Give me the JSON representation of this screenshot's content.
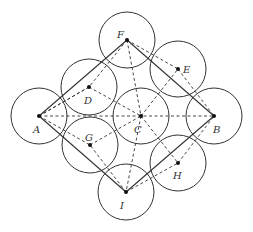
{
  "diagram": {
    "radius": 28,
    "points": {
      "A": {
        "x": 39,
        "y": 116,
        "label": "A",
        "lx": 33,
        "ly": 133
      },
      "B": {
        "x": 214,
        "y": 116,
        "label": "B",
        "lx": 213,
        "ly": 133
      },
      "C": {
        "x": 141,
        "y": 116,
        "label": "C",
        "lx": 134,
        "ly": 133
      },
      "D": {
        "x": 89,
        "y": 87,
        "label": "D",
        "lx": 84,
        "ly": 104
      },
      "E": {
        "x": 178,
        "y": 69,
        "label": "E",
        "lx": 183,
        "ly": 73
      },
      "F": {
        "x": 127,
        "y": 40,
        "label": "F",
        "lx": 117,
        "ly": 38
      },
      "G": {
        "x": 90,
        "y": 145,
        "label": "G",
        "lx": 85,
        "ly": 141
      },
      "H": {
        "x": 178,
        "y": 163,
        "label": "H",
        "lx": 173,
        "ly": 179
      },
      "I": {
        "x": 126,
        "y": 192,
        "label": "I",
        "lx": 120,
        "ly": 209
      }
    },
    "circles": [
      "A",
      "B",
      "C",
      "D",
      "E",
      "F",
      "G",
      "H",
      "I"
    ],
    "solid_segments": [
      [
        "A",
        "F"
      ],
      [
        "F",
        "B"
      ],
      [
        "B",
        "I"
      ],
      [
        "I",
        "A"
      ]
    ],
    "dashed_segments": [
      [
        "A",
        "B"
      ],
      [
        "A",
        "D"
      ],
      [
        "D",
        "C"
      ],
      [
        "A",
        "G"
      ],
      [
        "G",
        "C"
      ],
      [
        "F",
        "E"
      ],
      [
        "E",
        "B"
      ],
      [
        "I",
        "H"
      ],
      [
        "H",
        "B"
      ],
      [
        "F",
        "D"
      ],
      [
        "D",
        "A"
      ],
      [
        "I",
        "G"
      ],
      [
        "C",
        "E"
      ],
      [
        "C",
        "H"
      ],
      [
        "F",
        "C"
      ],
      [
        "C",
        "I"
      ]
    ]
  }
}
